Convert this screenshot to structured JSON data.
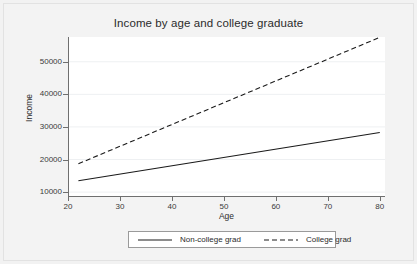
{
  "chart_data": {
    "type": "line",
    "title": "Income by age and college graduate",
    "xlabel": "Age",
    "ylabel": "Income",
    "xlim": [
      20,
      81
    ],
    "ylim": [
      8800,
      57600
    ],
    "grid": true,
    "grid_orientation": "horizontal",
    "legend_position": "bottom",
    "xticks": [
      20,
      30,
      40,
      50,
      60,
      70,
      80
    ],
    "xtick_labels": [
      "20",
      "30",
      "40",
      "50",
      "60",
      "70",
      "80"
    ],
    "yticks": [
      10000,
      20000,
      30000,
      40000,
      50000
    ],
    "ytick_labels": [
      "10000",
      "20000",
      "30000",
      "40000",
      "50000"
    ],
    "x": [
      22,
      80
    ],
    "series": [
      {
        "name": "Non-college grad",
        "style": "solid",
        "color": "#1a1a1a",
        "values": [
          13500,
          28300
        ]
      },
      {
        "name": "College grad",
        "style": "dashed",
        "color": "#1a1a1a",
        "values": [
          18700,
          57500
        ]
      }
    ]
  },
  "legend": {
    "entries": [
      {
        "label": "Non-college grad",
        "style": "solid"
      },
      {
        "label": "College grad",
        "style": "dashed"
      }
    ]
  },
  "colors": {
    "page_background": "#f3f3f3",
    "plot_background": "#ffffff",
    "axis": "#6f6f6f",
    "gridline": "#eef0f2",
    "text": "#2b2b2b",
    "line": "#1a1a1a"
  }
}
